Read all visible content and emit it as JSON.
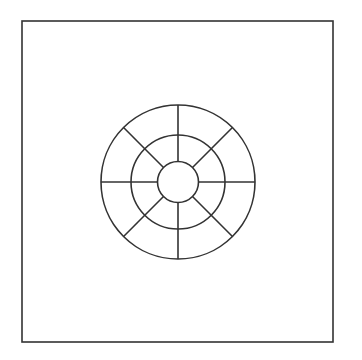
{
  "diagram": {
    "type": "concentric-wheel",
    "stroke_color": "#333333",
    "background_color": "#ffffff",
    "frame": {
      "x": 22,
      "y": 21,
      "width": 311,
      "height": 321,
      "stroke_width": 1.6
    },
    "center": {
      "x": 178,
      "y": 182
    },
    "rings": [
      {
        "name": "inner",
        "radius": 20.5
      },
      {
        "name": "middle",
        "radius": 47
      },
      {
        "name": "outer",
        "radius": 77
      }
    ],
    "spokes": {
      "count": 8,
      "angles_deg": [
        0,
        45,
        90,
        135,
        180,
        225,
        270,
        315
      ],
      "from_ring": "inner",
      "to_ring": "outer"
    },
    "stroke_width": 1.6
  }
}
